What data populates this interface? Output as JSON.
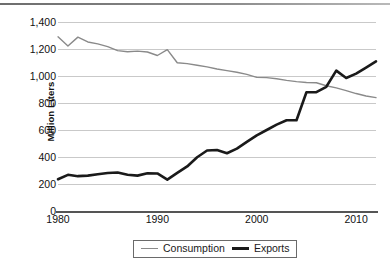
{
  "chart_data": {
    "type": "line",
    "title": "",
    "xlabel": "",
    "ylabel": "Million Liters",
    "xlim": [
      1980,
      2012
    ],
    "ylim": [
      0,
      1400
    ],
    "grid": true,
    "legend_position": "bottom-center",
    "yticks": [
      "0",
      "200",
      "400",
      "600",
      "800",
      "1,000",
      "1,200",
      "1,400"
    ],
    "ytick_values": [
      0,
      200,
      400,
      600,
      800,
      1000,
      1200,
      1400
    ],
    "xticks": [
      "1980",
      "1990",
      "2000",
      "2010"
    ],
    "xtick_values": [
      1980,
      1990,
      2000,
      2010
    ],
    "x": [
      1980,
      1981,
      1982,
      1983,
      1984,
      1985,
      1986,
      1987,
      1988,
      1989,
      1990,
      1991,
      1992,
      1993,
      1994,
      1995,
      1996,
      1997,
      1998,
      1999,
      2000,
      2001,
      2002,
      2003,
      2004,
      2005,
      2006,
      2007,
      2008,
      2009,
      2010,
      2011,
      2012
    ],
    "series": [
      {
        "name": "Consumption",
        "color": "#8a8a8a",
        "width": 1.4,
        "values": [
          1290,
          1222,
          1288,
          1252,
          1238,
          1218,
          1188,
          1180,
          1184,
          1178,
          1152,
          1195,
          1098,
          1092,
          1080,
          1068,
          1052,
          1040,
          1028,
          1012,
          990,
          988,
          980,
          968,
          958,
          952,
          950,
          928,
          912,
          892,
          870,
          852,
          840
        ]
      },
      {
        "name": "Exports",
        "color": "#1a1a1a",
        "width": 2.6,
        "values": [
          235,
          268,
          258,
          262,
          272,
          282,
          285,
          268,
          262,
          280,
          278,
          232,
          282,
          330,
          398,
          448,
          452,
          428,
          462,
          512,
          560,
          600,
          640,
          672,
          672,
          880,
          880,
          920,
          1040,
          985,
          1018,
          1062,
          1108
        ]
      }
    ]
  },
  "legend": {
    "items": [
      {
        "label": "Consumption",
        "style": "thin"
      },
      {
        "label": "Exports",
        "style": "thick"
      }
    ]
  },
  "caption": {
    "text": ""
  }
}
